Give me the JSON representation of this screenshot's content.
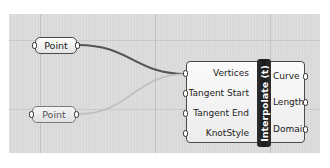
{
  "canvas": {
    "background": "#d9d9d9"
  },
  "nodes": [
    {
      "id": "point-1",
      "label": "Point",
      "selected": true
    },
    {
      "id": "point-2",
      "label": "Point",
      "selected": false
    }
  ],
  "component": {
    "name": "Interpolate (t)",
    "inputs": [
      {
        "label": "Vertices"
      },
      {
        "label": "Tangent Start"
      },
      {
        "label": "Tangent End"
      },
      {
        "label": "KnotStyle"
      }
    ],
    "outputs": [
      {
        "label": "Curve"
      },
      {
        "label": "Length"
      },
      {
        "label": "Domain"
      }
    ]
  },
  "wires": [
    {
      "from": "point-1",
      "to": "Vertices",
      "color": "#555555"
    },
    {
      "from": "point-2",
      "to": "Vertices",
      "color": "#c0c0c0"
    }
  ]
}
